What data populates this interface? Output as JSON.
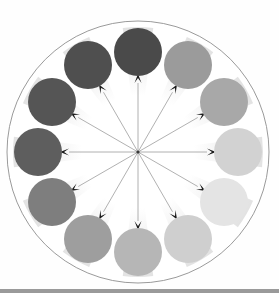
{
  "figure": {
    "canvas": {
      "width": 279,
      "height": 293
    },
    "background_color": "#fefefe",
    "bottom_bar_color": "#9a9a9a"
  },
  "boundary": {
    "name": "outer-boundary-circle",
    "center_x": 138,
    "center_y": 152,
    "radius": 131,
    "stroke_color": "#8f8f8f",
    "stroke_width": 0.9,
    "fill_color": "#ffffff"
  },
  "center": {
    "name": "hub-origin",
    "x": 138,
    "y": 152,
    "dot_color": "#3a3a3a",
    "dot_radius": 1.6
  },
  "wedge": {
    "name": "gradient-cone",
    "inner_color": "#ffffff",
    "outer_color": "#e2e2e2",
    "half_angle_deg": 7
  },
  "arrow": {
    "name": "radial-arrow",
    "line_color": "#9d9d9d",
    "line_width": 0.8,
    "head_color": "#1a1a1a",
    "head_length": 9,
    "head_width": 7,
    "length": 78
  },
  "chart_data": {
    "type": "scatter",
    "xlabel": "",
    "ylabel": "",
    "legend": "none",
    "grid": false,
    "polar": true,
    "radius_of_ring": 100,
    "node_radius": 24,
    "categories": [
      "12 o'clock",
      "1 o'clock",
      "2 o'clock",
      "3 o'clock",
      "4 o'clock",
      "5 o'clock",
      "6 o'clock",
      "7 o'clock",
      "8 o'clock",
      "9 o'clock",
      "10 o'clock",
      "11 o'clock"
    ],
    "nodes": [
      {
        "label": "12 o'clock",
        "angle_deg": 270,
        "value": 0.18,
        "color": "#4a4a4a",
        "cx": 138,
        "cy": 52
      },
      {
        "label": "1 o'clock",
        "angle_deg": 300,
        "value": 0.42,
        "color": "#9b9b9b",
        "cx": 188,
        "cy": 65
      },
      {
        "label": "2 o'clock",
        "angle_deg": 330,
        "value": 0.52,
        "color": "#a8a8a8",
        "cx": 224,
        "cy": 102
      },
      {
        "label": "3 o'clock",
        "angle_deg": 0,
        "value": 0.78,
        "color": "#d2d2d2",
        "cx": 238,
        "cy": 152
      },
      {
        "label": "4 o'clock",
        "angle_deg": 30,
        "value": 0.9,
        "color": "#e4e4e4",
        "cx": 224,
        "cy": 202
      },
      {
        "label": "5 o'clock",
        "angle_deg": 60,
        "value": 0.76,
        "color": "#cfcfcf",
        "cx": 188,
        "cy": 239
      },
      {
        "label": "6 o'clock",
        "angle_deg": 90,
        "value": 0.62,
        "color": "#b6b6b6",
        "cx": 138,
        "cy": 252
      },
      {
        "label": "7 o'clock",
        "angle_deg": 120,
        "value": 0.48,
        "color": "#9e9e9e",
        "cx": 88,
        "cy": 239
      },
      {
        "label": "8 o'clock",
        "angle_deg": 150,
        "value": 0.36,
        "color": "#7e7e7e",
        "cx": 52,
        "cy": 202
      },
      {
        "label": "9 o'clock",
        "angle_deg": 180,
        "value": 0.26,
        "color": "#5e5e5e",
        "cx": 38,
        "cy": 152
      },
      {
        "label": "10 o'clock",
        "angle_deg": 210,
        "value": 0.22,
        "color": "#555555",
        "cx": 52,
        "cy": 102
      },
      {
        "label": "11 o'clock",
        "angle_deg": 240,
        "value": 0.2,
        "color": "#4f4f4f",
        "cx": 88,
        "cy": 65
      }
    ]
  }
}
